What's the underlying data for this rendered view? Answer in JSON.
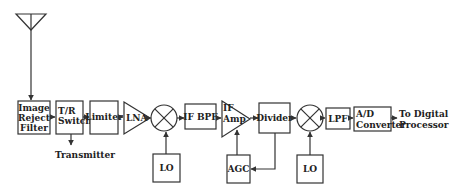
{
  "diagram": {
    "title": "",
    "type": "receiver block diagram",
    "nodes": [
      {
        "id": "antenna",
        "label": "",
        "shape": "antenna-icon"
      },
      {
        "id": "image_reject_filter",
        "lines": [
          "Image",
          "Reject",
          "Filter"
        ]
      },
      {
        "id": "tr_switch",
        "lines": [
          "T/R",
          "Switch"
        ]
      },
      {
        "id": "limiter",
        "lines": [
          "Limiter"
        ]
      },
      {
        "id": "lna",
        "lines": [
          "LNA"
        ],
        "shape": "triangle"
      },
      {
        "id": "mixer1",
        "label": "",
        "shape": "mixer-circle"
      },
      {
        "id": "lo1",
        "lines": [
          "LO"
        ]
      },
      {
        "id": "if_bpf",
        "lines": [
          "IF BPF"
        ]
      },
      {
        "id": "if_amp",
        "lines": [
          "IF",
          "Amp"
        ],
        "shape": "triangle"
      },
      {
        "id": "divider",
        "lines": [
          "Divider"
        ]
      },
      {
        "id": "agc",
        "lines": [
          "AGC"
        ]
      },
      {
        "id": "mixer2",
        "label": "",
        "shape": "mixer-circle"
      },
      {
        "id": "lo2",
        "lines": [
          "LO"
        ]
      },
      {
        "id": "lpf",
        "lines": [
          "LPF"
        ]
      },
      {
        "id": "ad_converter",
        "lines": [
          "A/D",
          "Converter"
        ]
      }
    ],
    "external_labels": {
      "transmitter": "Transmitter",
      "output": [
        "To Digital",
        "Processor"
      ]
    },
    "edges": [
      [
        "antenna",
        "image_reject_filter"
      ],
      [
        "image_reject_filter",
        "tr_switch"
      ],
      [
        "tr_switch",
        "transmitter"
      ],
      [
        "tr_switch",
        "limiter"
      ],
      [
        "limiter",
        "lna"
      ],
      [
        "lna",
        "mixer1"
      ],
      [
        "lo1",
        "mixer1"
      ],
      [
        "mixer1",
        "if_bpf"
      ],
      [
        "if_bpf",
        "if_amp"
      ],
      [
        "if_amp",
        "divider"
      ],
      [
        "divider",
        "agc"
      ],
      [
        "agc",
        "if_amp"
      ],
      [
        "divider",
        "mixer2"
      ],
      [
        "lo2",
        "mixer2"
      ],
      [
        "mixer2",
        "lpf"
      ],
      [
        "lpf",
        "ad_converter"
      ],
      [
        "ad_converter",
        "output"
      ]
    ]
  }
}
